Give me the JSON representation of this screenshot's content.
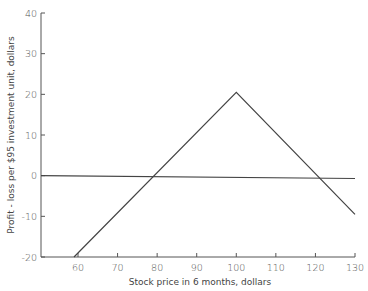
{
  "chart_data": {
    "type": "line",
    "title": "",
    "xlabel": "Stock price in 6 months, dollars",
    "ylabel": "Profit - loss per $95 investment unit, dollars",
    "xlim": [
      50.5,
      130
    ],
    "ylim": [
      -20,
      40
    ],
    "x_ticks": [
      60,
      70,
      80,
      90,
      100,
      110,
      120,
      130
    ],
    "y_ticks": [
      -20,
      -10,
      0,
      10,
      20,
      30,
      40
    ],
    "grid": false,
    "legend": null,
    "series": [
      {
        "name": "Profit-loss",
        "x": [
          59,
          100,
          130
        ],
        "y": [
          -20,
          20.5,
          -9.5
        ]
      },
      {
        "name": "Break-even (zero) line",
        "x": [
          50.5,
          130
        ],
        "y": [
          0,
          -0.7
        ]
      }
    ],
    "annotations": [
      {
        "label": "lower break-even",
        "x": 79.5,
        "y": 0
      },
      {
        "label": "upper break-even",
        "x": 121,
        "y": 0
      }
    ]
  },
  "colors": {
    "axis": "#555555",
    "line": "#444444",
    "text": "#555555"
  }
}
